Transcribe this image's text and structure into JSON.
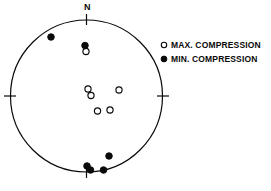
{
  "figure": {
    "type": "stereonet-scatter",
    "north_label": "N",
    "background_color": "#ffffff",
    "stroke_color": "#0a0a0a"
  },
  "legend": {
    "position": "right",
    "items": [
      {
        "marker": "open-circle",
        "label": "MAX. COMPRESSION",
        "fill": "#ffffff",
        "stroke": "#0a0a0a"
      },
      {
        "marker": "filled-circle",
        "label": "MIN. COMPRESSION",
        "fill": "#0a0a0a",
        "stroke": "#0a0a0a"
      }
    ]
  },
  "chart_data": {
    "type": "scatter",
    "title": "",
    "xlabel": "",
    "ylabel": "",
    "projection": "stereographic-lower-hemisphere",
    "grid": false,
    "legend_position": "right",
    "axis_ticks": [
      "N",
      "E",
      "S",
      "W"
    ],
    "net": {
      "cx": 86.5,
      "cy": 96.0,
      "r": 76.0
    },
    "xlim": [
      10.5,
      162.5
    ],
    "ylim": [
      20.0,
      172.0
    ],
    "series": [
      {
        "name": "MAX. COMPRESSION",
        "marker": "open-circle",
        "fill": "#ffffff",
        "stroke": "#0a0a0a",
        "radius": 3.1,
        "points": [
          {
            "x": 86.0,
            "y": 51.5
          },
          {
            "x": 88.0,
            "y": 89.0
          },
          {
            "x": 91.0,
            "y": 95.5
          },
          {
            "x": 119.0,
            "y": 90.0
          },
          {
            "x": 97.5,
            "y": 111.0
          },
          {
            "x": 110.0,
            "y": 110.0
          }
        ]
      },
      {
        "name": "MIN. COMPRESSION",
        "marker": "filled-circle",
        "fill": "#0a0a0a",
        "stroke": "#0a0a0a",
        "radius": 3.3,
        "points": [
          {
            "x": 51.0,
            "y": 37.0
          },
          {
            "x": 85.0,
            "y": 45.5
          },
          {
            "x": 109.0,
            "y": 156.0
          },
          {
            "x": 87.0,
            "y": 166.0
          },
          {
            "x": 90.5,
            "y": 170.0
          },
          {
            "x": 103.5,
            "y": 170.0
          }
        ]
      }
    ]
  }
}
